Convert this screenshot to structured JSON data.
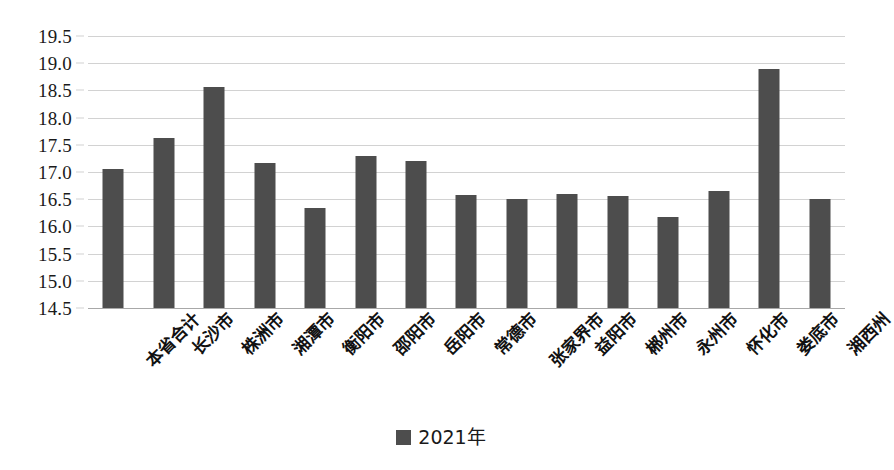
{
  "chart_data": {
    "type": "bar",
    "title": "",
    "xlabel": "",
    "ylabel": "",
    "ylim": [
      14.5,
      19.5
    ],
    "ytick_step": 0.5,
    "grid": true,
    "legend_position": "bottom-center",
    "categories": [
      "本省合计",
      "长沙市",
      "株洲市",
      "湘潭市",
      "衡阳市",
      "邵阳市",
      "岳阳市",
      "常德市",
      "张家界市",
      "益阳市",
      "郴州市",
      "永州市",
      "怀化市",
      "娄底市",
      "湘西州"
    ],
    "ytick_labels": [
      "19.5",
      "19.0",
      "18.5",
      "18.0",
      "17.5",
      "17.0",
      "16.5",
      "16.0",
      "15.5",
      "15.0",
      "14.5"
    ],
    "series": [
      {
        "name": "2021年",
        "color": "#4d4d4d",
        "values": [
          17.05,
          17.63,
          18.57,
          17.17,
          16.34,
          17.29,
          17.2,
          16.58,
          16.5,
          16.6,
          16.56,
          16.17,
          16.65,
          18.9,
          16.5
        ]
      }
    ]
  },
  "legend": {
    "items": [
      {
        "label": "2021年",
        "color": "#4d4d4d",
        "marker": "square-swatch"
      }
    ]
  },
  "colors": {
    "bar": "#4d4d4d",
    "gridline": "#d2d2d2",
    "baseline": "#a8a8a8",
    "background": "#ffffff",
    "text": "#1a1a1a"
  }
}
